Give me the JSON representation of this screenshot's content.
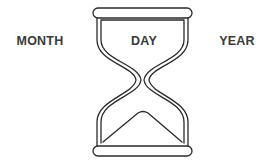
{
  "labels": {
    "left": "MONTH",
    "center": "DAY",
    "right": "YEAR"
  },
  "icon": "hourglass-icon",
  "colors": {
    "stroke": "#2a2a2a",
    "text": "#3a3a3a",
    "background": "#ffffff"
  }
}
